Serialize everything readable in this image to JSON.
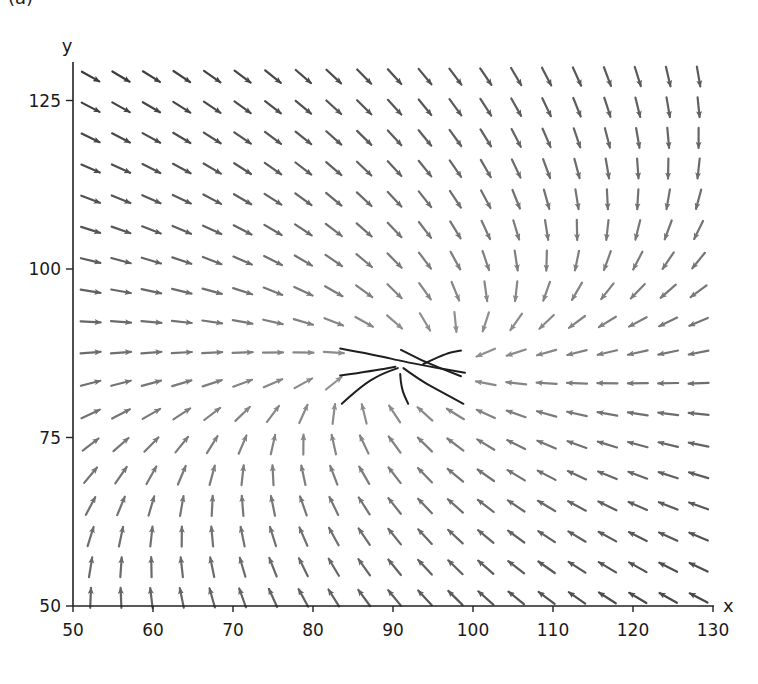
{
  "chart_data": {
    "type": "quiver",
    "title": "",
    "panel_label": "(a)",
    "xlabel": "x",
    "ylabel": "y",
    "xlim": [
      50,
      130
    ],
    "ylim": [
      50,
      131
    ],
    "xticks": [
      50,
      60,
      70,
      80,
      90,
      100,
      110,
      120,
      130
    ],
    "yticks": [
      50,
      75,
      100,
      125
    ],
    "grid": false,
    "legend": null,
    "equilibrium_point": {
      "x": 92,
      "y": 86,
      "type": "stable node"
    },
    "vector_field": {
      "description": "Linear approximation v = A (p - c), arrows normalized to equal length, shade darker for larger magnitude",
      "center": [
        92,
        86
      ],
      "matrix": [
        [
          -1.0,
          1.088
        ],
        [
          -0.136,
          -1.255
        ]
      ],
      "grid_x_start": 52.2,
      "grid_x_step": 3.8,
      "grid_x_count": 21,
      "grid_y_start": 51.2,
      "grid_y_step": 4.55,
      "grid_y_count": 18,
      "arrow_length_px": 20,
      "shade_min": "#9a9a9a",
      "shade_max": "#3a3a3a"
    },
    "streamlines": [
      {
        "points": [
          [
            83.4,
            88.2
          ],
          [
            88,
            87.2
          ],
          [
            91.5,
            86.2
          ],
          [
            99.0,
            84.6
          ]
        ]
      },
      {
        "points": [
          [
            91.0,
            88.0
          ],
          [
            93.5,
            86.4
          ],
          [
            98.5,
            84.1
          ]
        ]
      },
      {
        "points": [
          [
            93.8,
            85.9
          ],
          [
            96.5,
            87.5
          ],
          [
            98.5,
            87.9
          ]
        ]
      },
      {
        "points": [
          [
            83.4,
            84.2
          ],
          [
            88.0,
            85.0
          ],
          [
            90.3,
            85.5
          ]
        ]
      },
      {
        "points": [
          [
            83.6,
            80.0
          ],
          [
            86.0,
            82.6
          ],
          [
            88.5,
            84.4
          ],
          [
            90.6,
            85.3
          ]
        ]
      },
      {
        "points": [
          [
            90.9,
            84.4
          ],
          [
            91.0,
            82.3
          ],
          [
            91.9,
            80.0
          ]
        ]
      },
      {
        "points": [
          [
            91.3,
            85.3
          ],
          [
            93.5,
            83.4
          ],
          [
            96.3,
            81.6
          ],
          [
            98.8,
            80.0
          ]
        ]
      }
    ]
  },
  "colors": {
    "axis": "#222222",
    "streamline": "#1e1e1e"
  }
}
